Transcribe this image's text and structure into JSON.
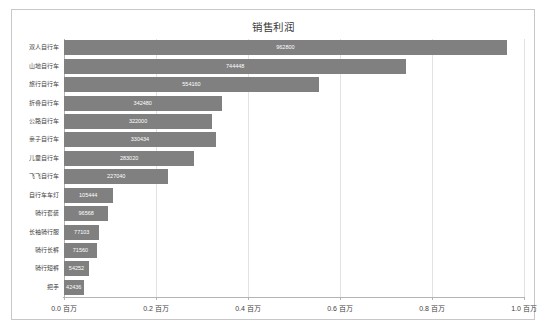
{
  "chart_data": {
    "type": "bar",
    "orientation": "horizontal",
    "title": "销售利润",
    "xlabel": "",
    "ylabel": "",
    "xlim": [
      0,
      1000000
    ],
    "grid": true,
    "legend": false,
    "bar_color": "#808080",
    "axis_unit_suffix": "百万",
    "tick_values": [
      0.0,
      0.2,
      0.4,
      0.6,
      0.8,
      1.0
    ],
    "tick_labels": [
      "0.0 百万",
      "0.2 百万",
      "0.4 百万",
      "0.6 百万",
      "0.8 百万",
      "1.0 百万"
    ],
    "categories": [
      "双人自行车",
      "山地自行车",
      "旅行自行车",
      "折叠自行车",
      "公路自行车",
      "亲子自行车",
      "儿童自行车",
      "飞飞自行车",
      "自行车车灯",
      "骑行套装",
      "长袖骑行服",
      "骑行长裤",
      "骑行短裤",
      "把手"
    ],
    "values": [
      962800,
      744448,
      554160,
      342480,
      322000,
      330434,
      283020,
      227040,
      105444,
      96568,
      77103,
      71560,
      54252,
      42436
    ],
    "value_labels": [
      "962800",
      "744448",
      "554160",
      "342480",
      "322000",
      "330434",
      "283020",
      "227040",
      "105444",
      "96568",
      "77103",
      "71560",
      "54252",
      "42436"
    ]
  }
}
